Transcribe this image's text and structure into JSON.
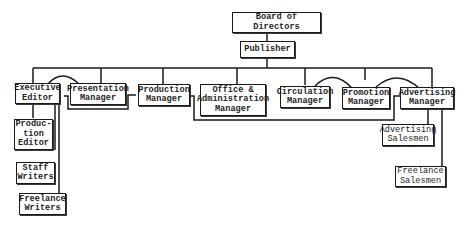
{
  "chart": {
    "nodes": {
      "board": "Board of Directors",
      "publisher": "Publisher",
      "executive_editor": "Executive\nEditor",
      "presentation_manager": "Presentation\nManager",
      "production_manager": "Production\nManager",
      "office_admin_manager": "Office &\nAdministration\nManager",
      "circulation_manager": "Circulation\nManager",
      "promotion_manager": "Promotion\nManager",
      "advertising_manager": "Advertising\nManager",
      "production_editor": "Produc-\ntion\nEditor",
      "staff_writers": "Staff\nWriters",
      "freelance_writers": "Freelance\nWriters",
      "advertising_salesmen": "Advertising\nSalesmen",
      "freelance_salesmen": "Freelance\nSalesmen"
    },
    "edges": [
      [
        "Board of Directors",
        "Publisher"
      ],
      [
        "Publisher",
        "Executive Editor"
      ],
      [
        "Publisher",
        "Presentation Manager"
      ],
      [
        "Publisher",
        "Production Manager"
      ],
      [
        "Publisher",
        "Office & Administration Manager"
      ],
      [
        "Publisher",
        "Circulation Manager"
      ],
      [
        "Publisher",
        "Promotion Manager"
      ],
      [
        "Publisher",
        "Advertising Manager"
      ],
      [
        "Executive Editor",
        "Production Editor"
      ],
      [
        "Executive Editor",
        "Staff Writers"
      ],
      [
        "Executive Editor",
        "Freelance Writers"
      ],
      [
        "Advertising Manager",
        "Advertising Salesmen"
      ],
      [
        "Advertising Manager",
        "Freelance Salesmen"
      ]
    ]
  }
}
